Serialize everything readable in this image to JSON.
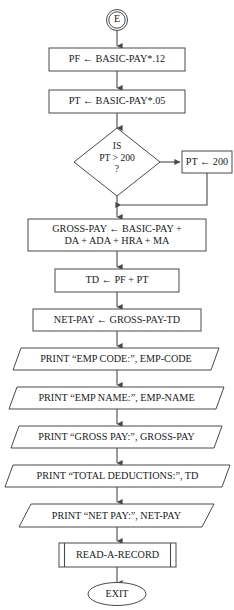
{
  "diagram": {
    "type": "flowchart",
    "colors": {
      "background": "#ffffff",
      "stroke": "#4a4a4a",
      "text": "#1a1a1a",
      "fill": "#ffffff"
    },
    "nodes": {
      "entry_connector": {
        "shape": "connector-circle",
        "label": "E"
      },
      "pf_assign": {
        "shape": "process-rectangle",
        "label": "PF ← BASIC-PAY*.12"
      },
      "pt_assign": {
        "shape": "process-rectangle",
        "label": "PT ← BASIC-PAY*.05"
      },
      "pt_decision": {
        "shape": "decision-diamond",
        "line1": "IS",
        "line2": "PT > 200",
        "line3": "?"
      },
      "pt_cap": {
        "shape": "process-rectangle",
        "label": "PT ← 200"
      },
      "gross_pay": {
        "shape": "process-rectangle",
        "line1": "GROSS-PAY ← BASIC-PAY +",
        "line2": "DA + ADA + HRA + MA"
      },
      "td_assign": {
        "shape": "process-rectangle",
        "label": "TD ← PF + PT"
      },
      "net_pay": {
        "shape": "process-rectangle",
        "label": "NET-PAY ← GROSS-PAY-TD"
      },
      "print_emp_code": {
        "shape": "io-parallelogram",
        "label": "PRINT “EMP CODE:”, EMP-CODE"
      },
      "print_emp_name": {
        "shape": "io-parallelogram",
        "label": "PRINT “EMP NAME:”, EMP-NAME"
      },
      "print_gross_pay": {
        "shape": "io-parallelogram",
        "label": "PRINT “GROSS PAY:”, GROSS-PAY"
      },
      "print_total_deductions": {
        "shape": "io-parallelogram",
        "label": "PRINT “TOTAL DEDUCTIONS:”, TD"
      },
      "print_net_pay": {
        "shape": "io-parallelogram",
        "label": "PRINT “NET PAY:”, NET-PAY"
      },
      "read_record": {
        "shape": "predefined-process",
        "label": "READ-A-RECORD"
      },
      "exit_terminal": {
        "shape": "terminator-ellipse",
        "label": "EXIT"
      }
    }
  }
}
